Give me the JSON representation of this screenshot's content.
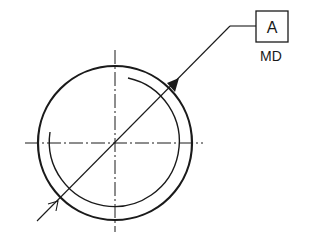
{
  "diagram": {
    "type": "gd&t-datum-drawing",
    "datum_box": {
      "label": "A"
    },
    "datum_note": {
      "label": "MD"
    },
    "colors": {
      "stroke": "#1a1a1a",
      "background": "#ffffff"
    }
  }
}
